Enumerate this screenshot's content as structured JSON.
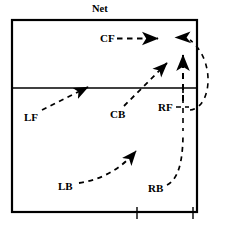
{
  "diagram": {
    "net_label": "Net",
    "colors": {
      "line": "#000000",
      "background": "#ffffff",
      "text": "#000000"
    },
    "court": {
      "left": 12,
      "top": 20,
      "right": 197,
      "bottom": 212,
      "midline_y": 88,
      "border_width": 2.2,
      "midline_width": 1.4
    },
    "positions": [
      {
        "code": "CF",
        "name": "center-front",
        "x": 100,
        "y": 34,
        "movement": "dashed arrow right toward right sideline"
      },
      {
        "code": "LF",
        "name": "left-front",
        "x": 24,
        "y": 113,
        "movement": "dashed arrow up-right to midline"
      },
      {
        "code": "CB",
        "name": "center-back",
        "x": 112,
        "y": 113,
        "movement": "dashed arrow up-right across midline"
      },
      {
        "code": "RF",
        "name": "right-front",
        "x": 159,
        "y": 103,
        "movement": "short dashed connector right to vertical path"
      },
      {
        "code": "LB",
        "name": "left-back",
        "x": 60,
        "y": 184,
        "movement": "curved dashed arrow up-right"
      },
      {
        "code": "RB",
        "name": "right-back",
        "x": 150,
        "y": 186,
        "movement": "curved dashed path up along right side then up to net"
      }
    ],
    "arrows": [
      {
        "name": "cf-arrow-right",
        "style": "dashed",
        "head": "right",
        "from": [
          116,
          38
        ],
        "to": [
          161,
          38
        ]
      },
      {
        "name": "net-corner-arrow-left",
        "style": "solid-head",
        "head": "left",
        "at": [
          178,
          37
        ]
      },
      {
        "name": "right-side-arrow-up",
        "style": "dashed",
        "head": "up",
        "from": [
          183,
          100
        ],
        "to": [
          183,
          50
        ]
      },
      {
        "name": "lf-arrow",
        "style": "dashed",
        "head": "up-right",
        "from": [
          43,
          108
        ],
        "to": [
          90,
          86
        ]
      },
      {
        "name": "cb-arrow",
        "style": "dashed",
        "head": "up-right",
        "from": [
          126,
          107
        ],
        "to": [
          170,
          61
        ]
      },
      {
        "name": "lb-arrow",
        "style": "dashed",
        "head": "up-right",
        "from": [
          79,
          182
        ],
        "to": [
          140,
          148
        ]
      },
      {
        "name": "rb-path",
        "style": "dashed",
        "head": "none",
        "from": [
          166,
          184
        ],
        "to": [
          183,
          130
        ]
      },
      {
        "name": "return-arc",
        "style": "dashed",
        "head": "arc",
        "from": [
          196,
          105
        ],
        "to": [
          186,
          40
        ]
      }
    ],
    "ticks": [
      {
        "name": "bottom-tick-center",
        "x": 137,
        "y1": 210,
        "y2": 220
      },
      {
        "name": "bottom-tick-right",
        "x": 193,
        "y1": 210,
        "y2": 220
      }
    ]
  }
}
